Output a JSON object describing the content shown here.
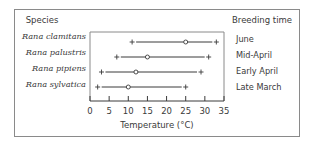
{
  "chart_data": {
    "type": "range-dot",
    "title": "",
    "xlabel": "Temperature (°C)",
    "ylabel": "Species",
    "right_column_title": "Breeding time",
    "xlim": [
      0,
      35
    ],
    "xticks": [
      0,
      5,
      10,
      15,
      20,
      25,
      30,
      35
    ],
    "grid": false,
    "legend": "none",
    "marker_meaning": {
      "plus": "temperature tolerance limits (min/max)",
      "circle": "optimum temperature"
    },
    "series": [
      {
        "species": "Rana clamitans",
        "breeding_time": "June",
        "min": 11,
        "optimum": 25,
        "max": 33
      },
      {
        "species": "Rana palustris",
        "breeding_time": "Mid-April",
        "min": 7,
        "optimum": 15,
        "max": 31
      },
      {
        "species": "Rana pipiens",
        "breeding_time": "Early April",
        "min": 3,
        "optimum": 12,
        "max": 29
      },
      {
        "species": "Rana sylvatica",
        "breeding_time": "Late March",
        "min": 2,
        "optimum": 10,
        "max": 25
      }
    ]
  },
  "labels": {
    "species_header": "Species",
    "breeding_header": "Breeding time",
    "axis_title": "Temperature (°C)",
    "ticks": [
      "0",
      "5",
      "10",
      "15",
      "20",
      "25",
      "30",
      "35"
    ],
    "species": [
      "Rana clamitans",
      "Rana palustris",
      "Rana pipiens",
      "Rana sylvatica"
    ],
    "breeding": [
      "June",
      "Mid-April",
      "Early April",
      "Late March"
    ]
  },
  "colors": {
    "ink": "#3a3a3a",
    "frame": "#8a8a8a"
  }
}
